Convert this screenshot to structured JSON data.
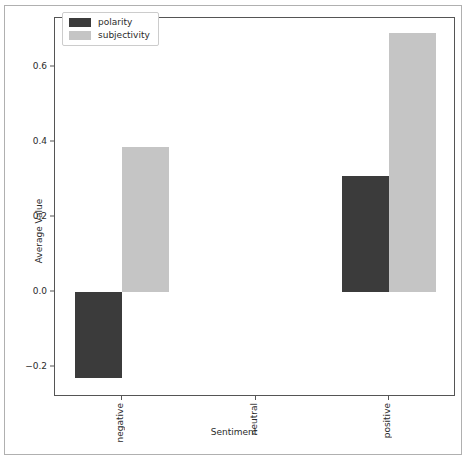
{
  "chart_data": {
    "type": "bar",
    "title": "",
    "xlabel": "Sentiment",
    "ylabel": "Average Value",
    "categories": [
      "negative",
      "neutral",
      "positive"
    ],
    "series": [
      {
        "name": "polarity",
        "color": "#3b3b3b",
        "values": [
          -0.23,
          0.0,
          0.31
        ]
      },
      {
        "name": "subjectivity",
        "color": "#c5c5c5",
        "values": [
          0.385,
          0.0,
          0.69
        ]
      }
    ],
    "ylim": [
      -0.28,
      0.73
    ],
    "yticks": [
      0.6,
      0.4,
      0.2,
      0.0,
      -0.2
    ],
    "ytick_labels": [
      "0.6",
      "0.4",
      "0.2",
      "0.0",
      "−0.2"
    ],
    "grid": false,
    "legend_position": "upper left",
    "orientation": "vertical",
    "bar_label_rotation": 90
  },
  "legend": {
    "entries": [
      {
        "label": "polarity",
        "color": "#3b3b3b"
      },
      {
        "label": "subjectivity",
        "color": "#c5c5c5"
      }
    ]
  },
  "axes": {
    "y_axis_label": "Average Value",
    "x_axis_label": "Sentiment"
  }
}
